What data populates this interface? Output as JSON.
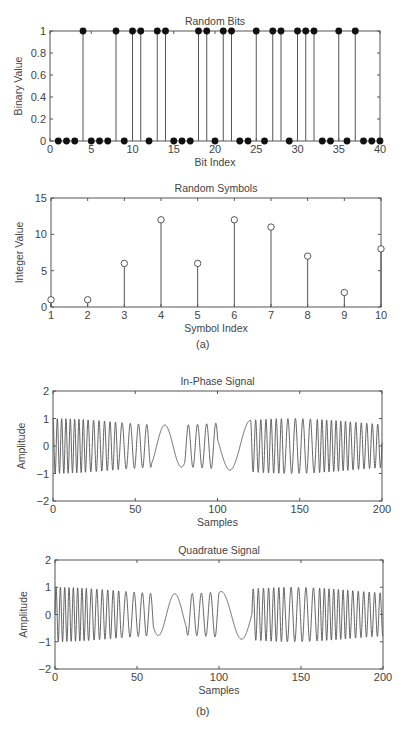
{
  "figure": {
    "caption_a": "(a)",
    "caption_b": "(b)"
  },
  "chart_data": [
    {
      "type": "stem",
      "title": "Random Bits",
      "xlabel": "Bit Index",
      "ylabel": "Binary Value",
      "xlim": [
        0,
        40
      ],
      "ylim": [
        0,
        1
      ],
      "xticks": [
        0,
        5,
        10,
        15,
        20,
        25,
        30,
        35,
        40
      ],
      "yticks": [
        0,
        0.2,
        0.4,
        0.6,
        0.8,
        1
      ],
      "marker": "filled-circle",
      "x": [
        1,
        2,
        3,
        4,
        5,
        6,
        7,
        8,
        9,
        10,
        11,
        12,
        13,
        14,
        15,
        16,
        17,
        18,
        19,
        20,
        21,
        22,
        23,
        24,
        25,
        26,
        27,
        28,
        29,
        30,
        31,
        32,
        33,
        34,
        35,
        36,
        37,
        38,
        39,
        40
      ],
      "values": [
        0,
        0,
        0,
        1,
        0,
        0,
        0,
        1,
        0,
        1,
        1,
        0,
        1,
        1,
        0,
        0,
        0,
        1,
        1,
        0,
        1,
        1,
        0,
        0,
        1,
        0,
        1,
        1,
        0,
        1,
        1,
        1,
        0,
        0,
        1,
        0,
        1,
        0,
        0,
        0
      ],
      "box": {
        "left": 50,
        "right": 380,
        "top": 31,
        "bottom": 141
      }
    },
    {
      "type": "stem",
      "title": "Random Symbols",
      "xlabel": "Symbol Index",
      "ylabel": "Integer Value",
      "xlim": [
        1,
        10
      ],
      "ylim": [
        0,
        15
      ],
      "xticks": [
        1,
        2,
        3,
        4,
        5,
        6,
        7,
        8,
        9,
        10
      ],
      "yticks": [
        0,
        5,
        10,
        15
      ],
      "marker": "open-circle",
      "x": [
        1,
        2,
        3,
        4,
        5,
        6,
        7,
        8,
        9,
        10
      ],
      "values": [
        1,
        1,
        6,
        12,
        6,
        12,
        11,
        7,
        2,
        8
      ],
      "box": {
        "left": 51,
        "right": 381,
        "top": 198,
        "bottom": 307
      }
    },
    {
      "type": "line",
      "title": "In-Phase Signal",
      "xlabel": "Samples",
      "ylabel": "Amplitude",
      "xlim": [
        0,
        200
      ],
      "ylim": [
        -2,
        2
      ],
      "xticks": [
        0,
        50,
        100,
        150,
        200
      ],
      "yticks": [
        -2,
        -1,
        0,
        1,
        2
      ],
      "description": "FSK-modulated cosine, amplitude ~±1, frequency varying per 20-sample symbol; slow segments near samples 47-60 and 80-97",
      "segment_cycles_per_sample": [
        0.38,
        0.3,
        0.2,
        0.05,
        0.18,
        0.04,
        0.32,
        0.22,
        0.35,
        0.3
      ],
      "box": {
        "left": 53,
        "right": 382,
        "top": 391,
        "bottom": 501
      }
    },
    {
      "type": "line",
      "title": "Quadratue Signal",
      "xlabel": "Samples",
      "ylabel": "Amplitude",
      "xlim": [
        0,
        200
      ],
      "ylim": [
        -2,
        2
      ],
      "xticks": [
        0,
        50,
        100,
        150,
        200
      ],
      "yticks": [
        -2,
        -1,
        0,
        1,
        2
      ],
      "description": "FSK-modulated sine (quadrature), amplitude ~±1, same frequency pattern as in-phase",
      "segment_cycles_per_sample": [
        0.38,
        0.3,
        0.2,
        0.05,
        0.18,
        0.04,
        0.32,
        0.22,
        0.35,
        0.3
      ],
      "box": {
        "left": 55,
        "right": 383,
        "top": 560,
        "bottom": 669
      }
    }
  ]
}
